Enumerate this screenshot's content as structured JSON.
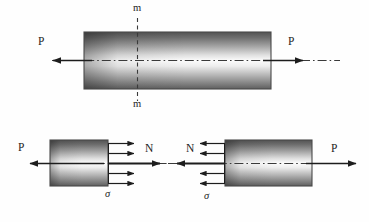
{
  "figure": {
    "title_visible": false,
    "type": "engineering-diagram",
    "colors": {
      "ink": "#1d1d1d",
      "bar_edge": "#4a4a4a",
      "bar_dark": "#5c5c5c",
      "bar_light": "#fbfbfb",
      "background": "#fefefe",
      "dash_line": "#3a3a3a"
    }
  },
  "top_figure": {
    "name": "full-bar-with-section",
    "bar": {
      "x": 84,
      "y": 32,
      "width": 187,
      "height": 57
    },
    "section_label_top": "m",
    "section_label_bottom": "m",
    "load_left_label": "P",
    "load_right_label": "P",
    "section_line_x": 137,
    "axis_y": 60
  },
  "bottom_left_figure": {
    "name": "left-free-body",
    "bar": {
      "x": 50,
      "y": 140,
      "width": 58,
      "height": 46
    },
    "load_label": "P",
    "resultant_label": "N",
    "stress_label": "σ",
    "stress_arrow_count": 4,
    "axis_y": 163
  },
  "bottom_right_figure": {
    "name": "right-free-body",
    "bar": {
      "x": 225,
      "y": 140,
      "width": 87,
      "height": 46
    },
    "load_label": "P",
    "resultant_label": "N",
    "stress_label": "σ",
    "stress_arrow_count": 4,
    "axis_y": 163
  }
}
